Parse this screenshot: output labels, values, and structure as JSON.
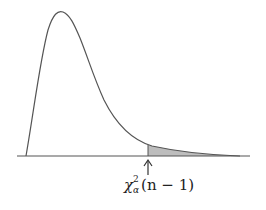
{
  "diagram": {
    "type": "chi-square density with shaded right tail",
    "curve_color": "#555555",
    "shade_color": "#bdbdbd",
    "axis_color": "#555555",
    "label": {
      "symbol": "χ",
      "superscript": "2",
      "subscript": "α",
      "argument": "(n − 1)"
    },
    "arrow": "up-arrow pointing to critical value"
  }
}
